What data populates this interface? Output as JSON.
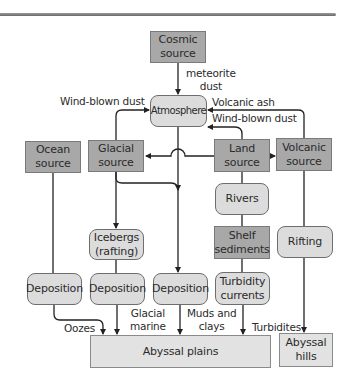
{
  "diagram": {
    "nodes": {
      "cosmic_source": "Cosmic\nsource",
      "atmosphere": "Atmosphere",
      "ocean_source": "Ocean\nsource",
      "glacial_source": "Glacial\nsource",
      "land_source": "Land\nsource",
      "volcanic_source": "Volcanic\nsource",
      "rivers": "Rivers",
      "shelf_sediments": "Shelf\nsediments",
      "icebergs": "Icebergs\n(rafting)",
      "rifting": "Rifting",
      "deposition_ocean": "Deposition",
      "deposition_glacial": "Deposition",
      "deposition_atmosphere": "Deposition",
      "turbidity_currents": "Turbidity\ncurrents",
      "abyssal_plains": "Abyssal plains",
      "abyssal_hills": "Abyssal\nhills"
    },
    "edge_labels": {
      "meteorite_dust": "meteorite\ndust",
      "wind_blown_dust_glacial": "Wind-blown dust",
      "volcanic_ash": "Volcanic ash",
      "wind_blown_dust_land": "Wind-blown dust",
      "oozes": "Oozes",
      "glacial_marine": "Glacial\nmarine",
      "muds_and_clays": "Muds and\nclays",
      "turbidites": "Turbidites"
    },
    "colors": {
      "source_fill": "#a8a8a8",
      "process_fill": "#dcdcdc",
      "sink_fill": "#e2e2e2",
      "line": "#222222"
    }
  }
}
